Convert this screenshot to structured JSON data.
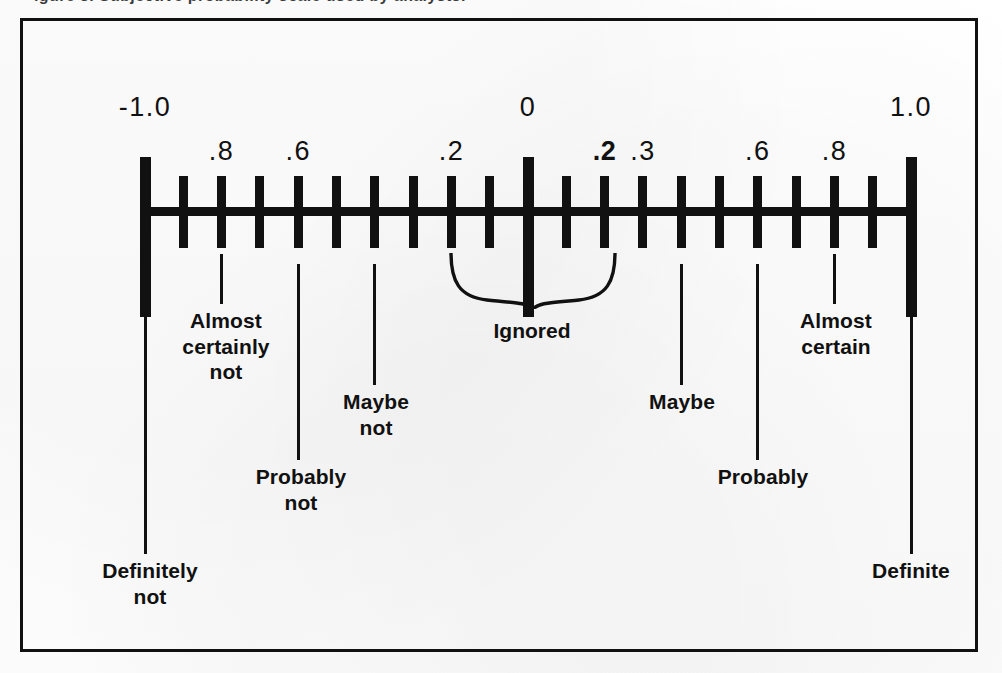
{
  "figure": {
    "caption_sliver": "igure 3.  Subjective probability scale used by analysts.",
    "frame_color": "#111111"
  },
  "chart_data": {
    "type": "scale",
    "axis_range": [
      -1.0,
      1.0
    ],
    "tick_step": 0.1,
    "grid": false,
    "legend_position": "none",
    "major_ticks": [
      {
        "value": -1.0,
        "label": "-1.0",
        "label_row": "top"
      },
      {
        "value": 0.0,
        "label": "0",
        "label_row": "top"
      },
      {
        "value": 1.0,
        "label": "1.0",
        "label_row": "top"
      }
    ],
    "minor_tick_values": [
      -0.9,
      -0.8,
      -0.7,
      -0.6,
      -0.5,
      -0.4,
      -0.3,
      -0.2,
      -0.1,
      0.1,
      0.2,
      0.3,
      0.4,
      0.5,
      0.6,
      0.7,
      0.8,
      0.9
    ],
    "tick_labels": [
      {
        "value": -1.0,
        "text": "-1.0",
        "row": "top",
        "bold": false
      },
      {
        "value": -0.8,
        "text": ".8",
        "row": "mid",
        "bold": false
      },
      {
        "value": -0.6,
        "text": ".6",
        "row": "mid",
        "bold": false
      },
      {
        "value": -0.2,
        "text": ".2",
        "row": "mid",
        "bold": false
      },
      {
        "value": 0.0,
        "text": "0",
        "row": "top",
        "bold": false
      },
      {
        "value": 0.2,
        "text": ".2",
        "row": "mid",
        "bold": true
      },
      {
        "value": 0.3,
        "text": ".3",
        "row": "mid",
        "bold": false
      },
      {
        "value": 0.6,
        "text": ".6",
        "row": "mid",
        "bold": false
      },
      {
        "value": 0.8,
        "text": ".8",
        "row": "mid",
        "bold": false
      },
      {
        "value": 1.0,
        "text": "1.0",
        "row": "top",
        "bold": false
      }
    ],
    "annotations": [
      {
        "value": -1.0,
        "text": "Definitely\nnot",
        "leader_top": 243,
        "leader_bottom": 533,
        "text_top": 537,
        "text_x": 127
      },
      {
        "value": -0.8,
        "text": "Almost\ncertainly\nnot",
        "leader_top": 233,
        "leader_bottom": 283,
        "text_top": 287,
        "text_x": 203
      },
      {
        "value": -0.6,
        "text": "Probably\nnot",
        "leader_top": 243,
        "leader_bottom": 439,
        "text_top": 443,
        "text_x": 278
      },
      {
        "value": -0.4,
        "text": "Maybe\nnot",
        "leader_top": 243,
        "leader_bottom": 364,
        "text_top": 368,
        "text_x": 353
      },
      {
        "value": 0.4,
        "text": "Maybe",
        "leader_top": 243,
        "leader_bottom": 364,
        "text_top": 368,
        "text_x": 659
      },
      {
        "value": 0.6,
        "text": "Probably",
        "leader_top": 243,
        "leader_bottom": 439,
        "text_top": 443,
        "text_x": 740
      },
      {
        "value": 0.8,
        "text": "Almost\ncertain",
        "leader_top": 233,
        "leader_bottom": 283,
        "text_top": 287,
        "text_x": 813
      },
      {
        "value": 1.0,
        "text": "Definite",
        "leader_top": 243,
        "leader_bottom": 533,
        "text_top": 537,
        "text_x": 888
      }
    ],
    "brace": {
      "label": "Ignored",
      "span_start": -0.2,
      "span_end": 0.2
    }
  }
}
